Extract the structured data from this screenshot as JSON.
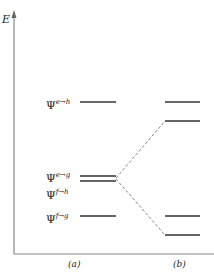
{
  "diagram": {
    "axis": {
      "label": "E"
    },
    "columns": [
      {
        "id": "a",
        "label": "(a)"
      },
      {
        "id": "b",
        "label": "(b)"
      }
    ],
    "levels_a": [
      {
        "psi": "Ψ",
        "sup": "e→h",
        "y": 102
      },
      {
        "psi": "Ψ",
        "sup": "e→g",
        "y": 176
      },
      {
        "psi": "Ψ",
        "sup": "f→h",
        "y": 181
      },
      {
        "psi": "Ψ",
        "sup": "f→g",
        "y": 216
      }
    ],
    "levels_b": [
      {
        "y": 102
      },
      {
        "y": 121
      },
      {
        "y": 216
      },
      {
        "y": 235
      }
    ],
    "colors": {
      "line": "#333333",
      "dashed": "#777777",
      "axis": "#888888"
    }
  }
}
